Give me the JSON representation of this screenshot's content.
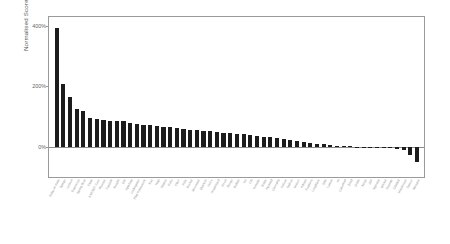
{
  "chart_data": {
    "type": "bar",
    "title": "",
    "subtitle": "",
    "xlabel": "",
    "ylabel": "Normalised Score",
    "ylim": [
      -100,
      430
    ],
    "ytick_values": [
      0,
      200,
      400
    ],
    "ytick_labels": [
      "0%",
      "200%",
      "400%"
    ],
    "grid": false,
    "legend": null,
    "bar_color": "#1c1c1c",
    "axis_color": "#9a9a9a",
    "categories": [
      "Ruby on Rails",
      "Django",
      "Laravel",
      "Express.js",
      "Spring Boot",
      "Flask",
      "ASP.NET Core",
      "Phoenix",
      "FastAPI",
      "NestJS",
      "Gin",
      "Symfony",
      "CodeIgniter",
      "Play Framework",
      "Koa",
      "Hapi",
      "Sinatra",
      "Echo",
      "Fiber",
      "Actix",
      "Rocket",
      "Micronaut",
      "Quarkus",
      "Vert.x",
      "Dropwizard",
      "Revel",
      "Beego",
      "Buffalo",
      "Iris",
      "Chi",
      "Tornado",
      "Bottle",
      "Pyramid",
      "CherryPy",
      "Falcon",
      "Sails.js",
      "Meteor",
      "Adonis",
      "Feathers",
      "LoopBack",
      "Slim",
      "Lumen",
      "Yii",
      "CakePHP",
      "Zend",
      "Grails",
      "Struts",
      "JSF",
      "Tapestry",
      "Wicket",
      "Seaside",
      "Catalyst",
      "Mojolicious",
      "Dancer",
      "Nitrogen"
    ],
    "values": [
      392,
      207,
      165,
      124,
      118,
      97,
      92,
      88,
      87,
      86,
      84,
      80,
      76,
      73,
      71,
      68,
      66,
      64,
      61,
      59,
      57,
      55,
      53,
      51,
      49,
      47,
      45,
      43,
      41,
      39,
      37,
      34,
      31,
      28,
      25,
      22,
      19,
      16,
      13,
      10,
      8,
      6,
      4,
      3,
      2,
      1,
      0,
      -1,
      -2,
      -3,
      -5,
      -7,
      -9,
      -28,
      -52
    ]
  }
}
